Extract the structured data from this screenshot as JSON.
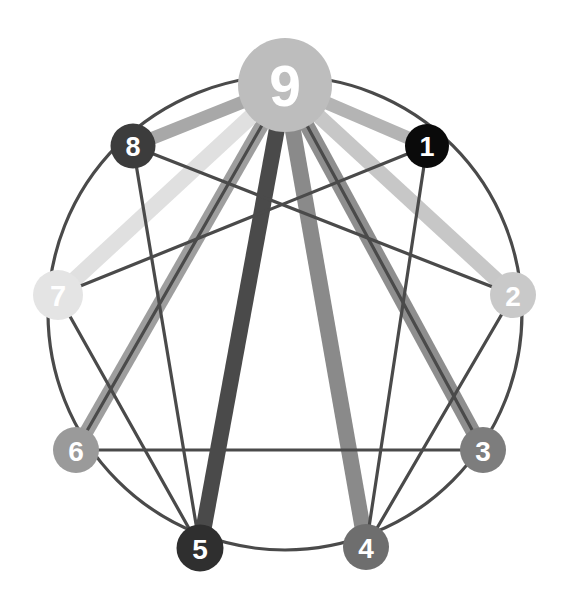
{
  "diagram": {
    "type": "enneagram-connection-graph",
    "canvas": {
      "width": 569,
      "height": 611
    },
    "background_color": "#ffffff",
    "circle": {
      "center_x": 285,
      "center_y": 313,
      "radius": 237,
      "stroke_color": "#4a4a4a",
      "stroke_width": 3.2
    },
    "thin_line_color": "#4a4a4a",
    "thin_line_width": 3.2
  },
  "nodes": [
    {
      "id": "1",
      "label": "1",
      "cx": 427,
      "cy": 146,
      "r": 22,
      "fill": "#0a0a0a",
      "font_size": 27
    },
    {
      "id": "2",
      "label": "2",
      "cx": 513,
      "cy": 295,
      "r": 23,
      "fill": "#c9c9c9",
      "font_size": 28
    },
    {
      "id": "3",
      "label": "3",
      "cx": 483,
      "cy": 450,
      "r": 23,
      "fill": "#7d7d7d",
      "font_size": 28
    },
    {
      "id": "4",
      "label": "4",
      "cx": 366,
      "cy": 547,
      "r": 23,
      "fill": "#6e6e6e",
      "font_size": 28
    },
    {
      "id": "5",
      "label": "5",
      "cx": 200,
      "cy": 548,
      "r": 23.5,
      "fill": "#2f2f2f",
      "font_size": 28
    },
    {
      "id": "6",
      "label": "6",
      "cx": 76,
      "cy": 450,
      "r": 23,
      "fill": "#9a9a9a",
      "font_size": 28
    },
    {
      "id": "7",
      "label": "7",
      "cx": 58,
      "cy": 295,
      "r": 25,
      "fill": "#e4e4e4",
      "font_size": 29
    },
    {
      "id": "8",
      "label": "8",
      "cx": 133,
      "cy": 146,
      "r": 22.5,
      "fill": "#3c3c3c",
      "font_size": 27
    },
    {
      "id": "9",
      "label": "9",
      "cx": 285,
      "cy": 85,
      "r": 47,
      "fill": "#bdbdbd",
      "font_size": 57
    }
  ],
  "thin_connections": [
    {
      "from": "9",
      "to": "3",
      "kind": "triangle"
    },
    {
      "from": "3",
      "to": "6",
      "kind": "triangle"
    },
    {
      "from": "6",
      "to": "9",
      "kind": "triangle"
    },
    {
      "from": "1",
      "to": "4",
      "kind": "hexad"
    },
    {
      "from": "4",
      "to": "2",
      "kind": "hexad"
    },
    {
      "from": "2",
      "to": "8",
      "kind": "hexad"
    },
    {
      "from": "8",
      "to": "5",
      "kind": "hexad"
    },
    {
      "from": "5",
      "to": "7",
      "kind": "hexad"
    },
    {
      "from": "7",
      "to": "1",
      "kind": "hexad"
    }
  ],
  "highlight_connections": [
    {
      "from": "9",
      "to": "1",
      "color": "#b4b4b4",
      "width": 13
    },
    {
      "from": "9",
      "to": "2",
      "color": "#c7c7c7",
      "width": 15
    },
    {
      "from": "9",
      "to": "3",
      "color": "#8e8e8e",
      "width": 15
    },
    {
      "from": "9",
      "to": "4",
      "color": "#8a8a8a",
      "width": 16
    },
    {
      "from": "9",
      "to": "5",
      "color": "#4a4a4a",
      "width": 16
    },
    {
      "from": "9",
      "to": "6",
      "color": "#9e9e9e",
      "width": 14
    },
    {
      "from": "9",
      "to": "7",
      "color": "#e0e0e0",
      "width": 16
    },
    {
      "from": "9",
      "to": "8",
      "color": "#a8a8a8",
      "width": 13
    }
  ],
  "chart_data": {
    "type": "diagram",
    "categories": [
      "1",
      "2",
      "3",
      "4",
      "5",
      "6",
      "7",
      "8",
      "9"
    ],
    "node_shades": {
      "1": "#0a0a0a",
      "2": "#c9c9c9",
      "3": "#7d7d7d",
      "4": "#6e6e6e",
      "5": "#2f2f2f",
      "6": "#9a9a9a",
      "7": "#e4e4e4",
      "8": "#3c3c3c",
      "9": "#bdbdbd"
    },
    "hub": "9",
    "edge_weights_from_hub": {
      "1": 13,
      "2": 15,
      "3": 15,
      "4": 16,
      "5": 16,
      "6": 14,
      "7": 16,
      "8": 13
    }
  }
}
